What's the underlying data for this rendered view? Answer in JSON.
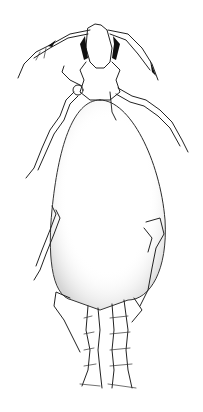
{
  "image": {
    "kind": "scientific line illustration",
    "subject": "engorged arthropod (mite/chigger-like), dorsal view",
    "background_color": "#ffffff",
    "ink_color": "#222222",
    "stipple_color": "#9a9a9a"
  }
}
